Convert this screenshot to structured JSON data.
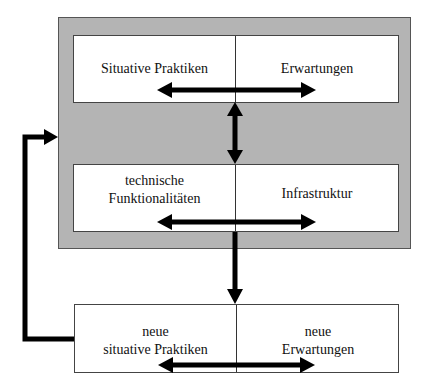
{
  "diagram": {
    "top_box": {
      "left_label": "Situative Praktiken",
      "right_label": "Erwartungen"
    },
    "middle_box": {
      "left_label_line1": "technische",
      "left_label_line2": "Funktionalitäten",
      "right_label": "Infrastruktur"
    },
    "bottom_box": {
      "left_label_line1": "neue",
      "left_label_line2": "situative Praktiken",
      "right_label_line1": "neue",
      "right_label_line2": "Erwartungen"
    },
    "colors": {
      "panel_gray": "#b4b4b4",
      "box_fill": "#ffffff",
      "arrow": "#000000"
    }
  }
}
